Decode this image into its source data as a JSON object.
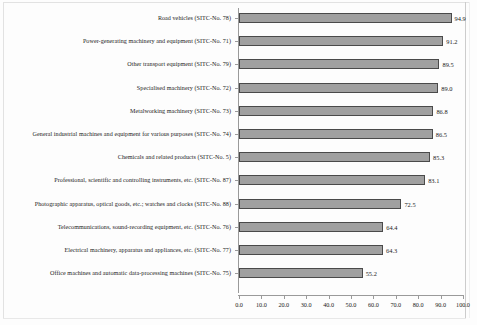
{
  "chart_data": {
    "type": "bar",
    "orientation": "horizontal",
    "title": "",
    "xlabel": "",
    "ylabel": "",
    "xlim": [
      0.0,
      100.0
    ],
    "xticks": [
      "0.0",
      "10.0",
      "20.0",
      "30.0",
      "40.0",
      "50.0",
      "60.0",
      "70.0",
      "80.0",
      "90.0",
      "100.0"
    ],
    "grid": false,
    "legend": false,
    "bar_color": "#a0a0a0",
    "bar_border_color": "#4a4a4a",
    "axis_color": "#9a9a9a",
    "categories": [
      "Road vehicles (SITC-No. 78)",
      "Power-generating machinery and equipment (SITC-No. 71)",
      "Other transport equipment (SITC-No. 79)",
      "Specialised machinery (SITC-No. 72)",
      "Metalworking machinery (SITC-No. 73)",
      "General industrial machines and equipment for various purposes (SITC-No. 74)",
      "Chemicals and related products (SITC-No. 5)",
      "Professional, scientific and controlling instruments, etc. (SITC-No. 87)",
      "Photographic apparatus, optical goods, etc.; watches and clocks (SITC-No. 88)",
      "Telecommunications, sound-recording equipment, etc. (SITC-No. 76)",
      "Electrical machinery, apparatus and appliances, etc. (SITC-No. 77)",
      "Office machines and automatic data-processing machines (SITC-No. 75)"
    ],
    "values": [
      94.9,
      91.2,
      89.5,
      89.0,
      86.8,
      86.5,
      85.3,
      83.1,
      72.5,
      64.4,
      64.3,
      55.2
    ],
    "value_labels": [
      "94.9",
      "91.2",
      "89.5",
      "89.0",
      "86.8",
      "86.5",
      "85.3",
      "83.1",
      "72.5",
      "64.4",
      "64.3",
      "55.2"
    ]
  }
}
